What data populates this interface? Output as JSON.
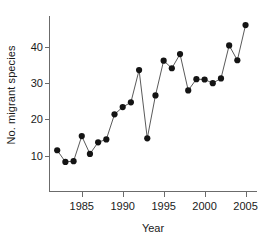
{
  "chart_data": {
    "type": "line",
    "title": "",
    "xlabel": "Year",
    "ylabel": "No. migrant species",
    "x": [
      1982,
      1983,
      1984,
      1985,
      1986,
      1987,
      1988,
      1989,
      1990,
      1991,
      1992,
      1993,
      1994,
      1995,
      1996,
      1997,
      1998,
      1999,
      2000,
      2001,
      2002,
      2003,
      2004,
      2005
    ],
    "values": [
      11.5,
      8.3,
      8.5,
      15.4,
      10.5,
      13.7,
      14.5,
      21.4,
      23.4,
      24.7,
      33.6,
      14.8,
      26.6,
      36.2,
      34.1,
      38.0,
      28.0,
      31.1,
      31.0,
      30.0,
      31.3,
      40.4,
      36.3,
      46.0
    ],
    "xlim": [
      1981.0,
      2006.4
    ],
    "ylim": [
      0,
      48.5
    ],
    "xticks": [
      1985,
      1990,
      1995,
      2000,
      2005
    ],
    "xticklabels": [
      "1985",
      "1990",
      "1995",
      "2000",
      "2005"
    ],
    "yticks": [
      10,
      20,
      30,
      40
    ],
    "yticklabels": [
      "10",
      "20",
      "30",
      "40"
    ],
    "grid": false,
    "legend": null,
    "marker": "filled-circle",
    "marker_color": "#141414",
    "line_color": "#5a5a5a",
    "axis_color": "#6b6b6b"
  }
}
